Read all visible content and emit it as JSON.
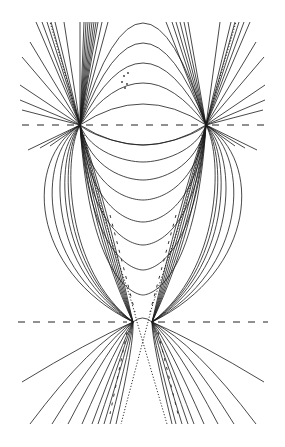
{
  "figure": {
    "width": 285,
    "height": 447,
    "background": "#ffffff",
    "stroke_color": "#1a1a1a",
    "focal_points": {
      "upper_left": [
        80,
        125
      ],
      "upper_right": [
        206,
        125
      ],
      "lower_left": [
        133,
        322
      ],
      "lower_right": [
        152,
        322
      ]
    },
    "axes": {
      "upper": {
        "y": 125,
        "x_start": 22,
        "x_end": 265
      },
      "lower": {
        "y": 322,
        "x_start": 18,
        "x_end": 268
      }
    },
    "upper_arcs_peak_y": [
      23,
      43,
      63,
      83,
      104
    ],
    "lower_arcs_between_upper_foci_peak_y": [
      145
    ],
    "u_curves_bottom_y": [
      145,
      162,
      180,
      200,
      222,
      245,
      270,
      295
    ],
    "outer_bulge_left_x": [
      34,
      45,
      56,
      63,
      68,
      72
    ],
    "outer_bulge_right_x": [
      252,
      241,
      230,
      223,
      218,
      214
    ],
    "top_fan_left_end_x": [
      22,
      30,
      36,
      42,
      47,
      51,
      55
    ],
    "top_fan_right_end_x": [
      264,
      256,
      250,
      244,
      239,
      235,
      231
    ],
    "bottom_fan_left_end_x": [
      22,
      30,
      52,
      68,
      82,
      92,
      98,
      104,
      110,
      116
    ],
    "bottom_fan_right_end_x": [
      264,
      256,
      234,
      218,
      204,
      194,
      188,
      182,
      176,
      172
    ],
    "bottom_fan_end_y": 424,
    "dotted_bottom_end_x": [
      121,
      167
    ],
    "small_dots": [
      [
        124,
        76
      ],
      [
        128,
        73
      ],
      [
        122,
        82
      ],
      [
        127,
        84
      ],
      [
        125,
        88
      ]
    ]
  }
}
